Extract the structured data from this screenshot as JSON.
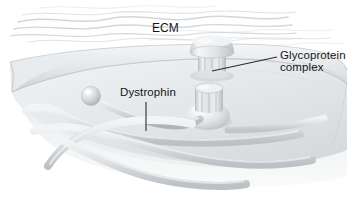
{
  "figure": {
    "width": 349,
    "height": 202,
    "background": "#ffffff"
  },
  "labels": {
    "ecm": "ECM",
    "glycoprotein_line1": "Glycoprotein",
    "glycoprotein_line2": "complex",
    "dystrophin": "Dystrophin"
  },
  "colors": {
    "text": "#161616",
    "leader_line": "#2b2b2b",
    "membrane_light": "#eceef0",
    "membrane_mid": "#dadde0",
    "membrane_dark": "#c2c6ca",
    "membrane_edge": "#b2b7bb",
    "protein_light": "#f2f3f4",
    "protein_mid": "#d8dbde",
    "protein_shadow": "#b6babe",
    "filament_light": "#eef0f1",
    "filament_mid": "#d2d6d9",
    "filament_dark": "#b9bec2",
    "ecm_fiber": "#cfd3d6"
  },
  "structures": {
    "ecm_region_label": "extracellular-matrix-fibers",
    "membrane_label": "cell-membrane-sheet",
    "glycoprotein_upper_label": "glycoprotein-complex-upper",
    "glycoprotein_lower_label": "glycoprotein-complex-lower",
    "dystrophin_rod_label": "dystrophin-rod",
    "dystrophin_head_label": "dystrophin-globular-head",
    "filaments_label": "actin-filaments"
  }
}
